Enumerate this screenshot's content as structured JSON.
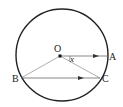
{
  "diagram": {
    "type": "geometry",
    "shape": "circle",
    "points": {
      "O": {
        "label": "O",
        "x": 60,
        "y": 56
      },
      "A": {
        "label": "A",
        "x": 107,
        "y": 56
      },
      "B": {
        "label": "B",
        "x": 21,
        "y": 78
      },
      "C": {
        "label": "C",
        "x": 100,
        "y": 78
      }
    },
    "angle_label": "x",
    "segments": [
      "OA (arrow)",
      "OB",
      "OC",
      "BC (arrow)"
    ],
    "colors": {
      "stroke": "#333333",
      "circle": "#222222"
    }
  }
}
